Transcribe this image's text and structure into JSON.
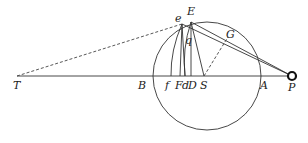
{
  "diagram": {
    "title": "",
    "points": [
      {
        "id": "T",
        "label": "T",
        "x": 17,
        "y": 76,
        "lx": 13,
        "ly": 89
      },
      {
        "id": "B",
        "label": "B",
        "x": 154,
        "y": 76,
        "lx": 138,
        "ly": 89
      },
      {
        "id": "f",
        "label": "f",
        "x": 171,
        "y": 76,
        "lx": 165,
        "ly": 89
      },
      {
        "id": "F",
        "label": "F",
        "x": 180,
        "y": 76,
        "lx": 175,
        "ly": 89
      },
      {
        "id": "d",
        "label": "d",
        "x": 185,
        "y": 76,
        "lx": 182,
        "ly": 89
      },
      {
        "id": "D",
        "label": "D",
        "x": 191,
        "y": 76,
        "lx": 188,
        "ly": 89
      },
      {
        "id": "S",
        "label": "S",
        "x": 204,
        "y": 76,
        "lx": 200,
        "ly": 89
      },
      {
        "id": "A",
        "label": "A",
        "x": 261,
        "y": 76,
        "lx": 260,
        "ly": 89
      },
      {
        "id": "P",
        "label": "P",
        "x": 292,
        "y": 76,
        "lx": 288,
        "ly": 91
      },
      {
        "id": "e",
        "label": "e",
        "x": 182,
        "y": 24,
        "lx": 175,
        "ly": 22
      },
      {
        "id": "E",
        "label": "E",
        "x": 191,
        "y": 22,
        "lx": 187,
        "ly": 15
      },
      {
        "id": "q",
        "label": "q",
        "x": 186,
        "y": 42,
        "lx": 185,
        "ly": 44
      },
      {
        "id": "G",
        "label": "G",
        "x": 228,
        "y": 37,
        "lx": 226,
        "ly": 38
      }
    ],
    "circle": {
      "cx": 207,
      "cy": 76,
      "r": 54
    },
    "solid_lines": [
      [
        "T",
        "P"
      ],
      [
        "E",
        "P"
      ],
      [
        "e",
        "P"
      ],
      [
        "E",
        "D"
      ],
      [
        "E",
        "S"
      ],
      [
        "e",
        "F"
      ],
      [
        "e",
        "d"
      ]
    ],
    "dashed_lines": [
      [
        "T",
        "e"
      ],
      [
        "S",
        "G"
      ]
    ],
    "curves": [
      {
        "from": "e",
        "to": "f",
        "note": "arc"
      },
      {
        "from": "E",
        "to": "d",
        "note": "arc through q"
      }
    ],
    "body_marker": {
      "at": "P",
      "r": 4
    }
  }
}
